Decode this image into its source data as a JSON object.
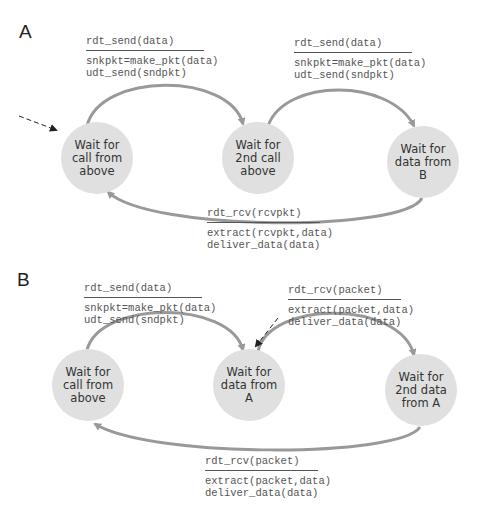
{
  "colors": {
    "state_fill": "#e0e0e0",
    "arrow": "#999999",
    "text": "#333333",
    "code": "#555555"
  },
  "panels": [
    {
      "label": "A",
      "states": [
        {
          "id": "a1",
          "text": "Wait for\ncall from\nabove",
          "cx": 97,
          "cy": 158,
          "initial": true
        },
        {
          "id": "a2",
          "text": "Wait for\n2nd call\nabove",
          "cx": 258,
          "cy": 158
        },
        {
          "id": "a3",
          "text": "Wait for\ndata from\nB",
          "cx": 423,
          "cy": 162
        }
      ],
      "transitions": [
        {
          "from": "a1",
          "to": "a2",
          "event": "rdt_send(data)",
          "action": "snkpkt=make_pkt(data)\nudt_send(sndpkt)"
        },
        {
          "from": "a2",
          "to": "a3",
          "event": "rdt_send(data)",
          "action": "snkpkt=make_pkt(data)\nudt_send(sndpkt)"
        },
        {
          "from": "a3",
          "to": "a1",
          "event": "rdt_rcv(rcvpkt)",
          "action": "extract(rcvpkt,data)\ndeliver_data(data)"
        }
      ]
    },
    {
      "label": "B",
      "states": [
        {
          "id": "b1",
          "text": "Wait for\ncall from\nabove",
          "cx": 88,
          "cy": 385
        },
        {
          "id": "b2",
          "text": "Wait for\ndata from\nA",
          "cx": 249,
          "cy": 385,
          "initial": true
        },
        {
          "id": "b3",
          "text": "Wait for\n2nd data\nfrom A",
          "cx": 421,
          "cy": 390
        }
      ],
      "transitions": [
        {
          "from": "b1",
          "to": "b2",
          "event": "rdt_send(data)",
          "action": "snkpkt=make_pkt(data)\nudt_send(sndpkt)"
        },
        {
          "from": "b2",
          "to": "b3",
          "event": "rdt_rcv(packet)",
          "action": "extract(packet,data)\ndeliver_data(data)"
        },
        {
          "from": "b3",
          "to": "b1",
          "event": "rdt_rcv(packet)",
          "action": "extract(packet,data)\ndeliver_data(data)"
        }
      ]
    }
  ]
}
